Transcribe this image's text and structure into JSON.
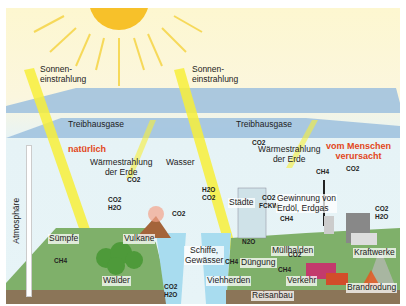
{
  "labels": {
    "sun_left": "Sonnen-\neinstrahlung",
    "sun_right": "Sonnen-\neinstrahlung",
    "greenhouse_left": "Treibhausgase",
    "greenhouse_right": "Treibhausgase",
    "atmosphere": "Atmosphäre",
    "natural": "natürlich",
    "human": "vom Menschen\nverursacht",
    "heat_left": "Wärmestrahlung\nder Erde",
    "heat_right": "Wärmestrahlung\nder Erde",
    "water": "Wasser"
  },
  "sources_natural": [
    {
      "name": "Sümpfe",
      "gases": "CH4"
    },
    {
      "name": "Wälder",
      "gases": "CO2\nH2O"
    },
    {
      "name": "Vulkane",
      "gases": "CO2"
    },
    {
      "name": "Ozean (Aufnahme)",
      "gases": "CO2"
    },
    {
      "name": "Ozean (Abgabe)",
      "gases": "CO2\nH2O"
    }
  ],
  "sources_human": [
    {
      "name": "Schiffe,\nGewässer",
      "gases": "H2O\nCO2"
    },
    {
      "name": "Städte",
      "gases": "CO2\nFCKW"
    },
    {
      "name": "Flugzeug",
      "gases": "CO2"
    },
    {
      "name": "Gewinnung von\nErdöl, Erdgas",
      "gases": "CH4"
    },
    {
      "name": "Kraftwerke",
      "gases": "CO2"
    },
    {
      "name": "Müllhalden",
      "gases": "CH4"
    },
    {
      "name": "Düngung",
      "gases": "N2O"
    },
    {
      "name": "Viehherden",
      "gases": "CH4"
    },
    {
      "name": "Reisanbau",
      "gases": "CH4"
    },
    {
      "name": "Verkehr",
      "gases": "CO2"
    },
    {
      "name": "Brandrodung",
      "gases": "CO2\nH2O"
    }
  ],
  "colors": {
    "sun": "#f7c12a",
    "beam": "#f7ef3a",
    "gas_layer": "#8fb7d8",
    "accent_red": "#e2461b",
    "land": "#7fb06a",
    "water": "#a8dcef"
  }
}
